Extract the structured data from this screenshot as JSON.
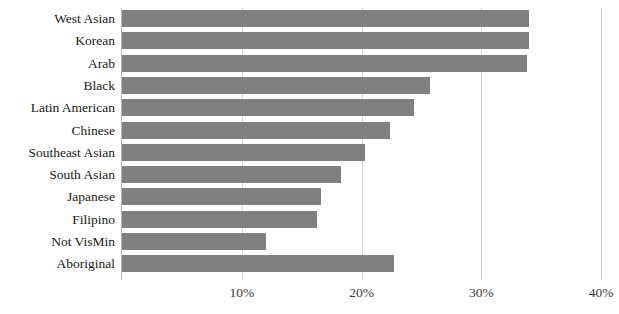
{
  "chart_data": {
    "type": "bar",
    "orientation": "horizontal",
    "title": "",
    "subtitle": "",
    "xlabel": "",
    "ylabel": "",
    "xlim": [
      0,
      41.5
    ],
    "grid": "vertical-only",
    "legend": "none",
    "bar_color": "#808080",
    "axis_color": "#b9b9b9",
    "gridline_color": "#d4d4d4",
    "tick_format": "percent",
    "xticks": [
      10,
      20,
      30,
      40
    ],
    "xtick_labels": [
      "10%",
      "20%",
      "30%",
      "40%"
    ],
    "categories": [
      "West Asian",
      "Korean",
      "Arab",
      "Black",
      "Latin American",
      "Chinese",
      "Southeast Asian",
      "South Asian",
      "Japanese",
      "Filipino",
      "Not VisMin",
      "Aboriginal"
    ],
    "values": [
      34.0,
      34.0,
      33.8,
      25.7,
      24.4,
      22.4,
      20.3,
      18.3,
      16.6,
      16.3,
      12.0,
      22.7
    ]
  }
}
